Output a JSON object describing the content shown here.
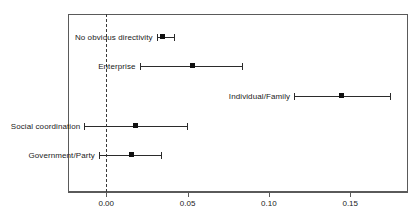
{
  "chart_data": {
    "type": "scatter",
    "subtype": "dot-and-whisker coefficient plot",
    "title": "",
    "xlabel": "",
    "ylabel": "",
    "xlim": [
      -0.0235,
      0.1855
    ],
    "xticks": [
      0.0,
      0.05,
      0.1,
      0.15
    ],
    "xtick_labels": [
      "0.00",
      "0.05",
      "0.10",
      "0.15"
    ],
    "grid": false,
    "legend": null,
    "reference_line": {
      "value": 0.0,
      "style": "dashed",
      "orientation": "vertical"
    },
    "categories": [
      "No obvious directivity",
      "Enterprise",
      "Individual/Family",
      "Social coordination",
      "Government/Party"
    ],
    "points": [
      {
        "label": "No obvious directivity",
        "estimate": 0.034,
        "ci_low": 0.031,
        "ci_high": 0.0415
      },
      {
        "label": "Enterprise",
        "estimate": 0.0525,
        "ci_low": 0.0205,
        "ci_high": 0.0835
      },
      {
        "label": "Individual/Family",
        "estimate": 0.1445,
        "ci_low": 0.1155,
        "ci_high": 0.1745
      },
      {
        "label": "Social coordination",
        "estimate": 0.0175,
        "ci_low": -0.0135,
        "ci_high": 0.0495
      },
      {
        "label": "Government/Party",
        "estimate": 0.0155,
        "ci_low": -0.0045,
        "ci_high": 0.0335
      }
    ],
    "colors": {
      "point": "#101010",
      "errorbar": "#2b2b2b",
      "reference_line": "#3a3a3a",
      "frame": "#5a5a5a",
      "text": "#1a1a1a",
      "background": "#ffffff"
    }
  }
}
